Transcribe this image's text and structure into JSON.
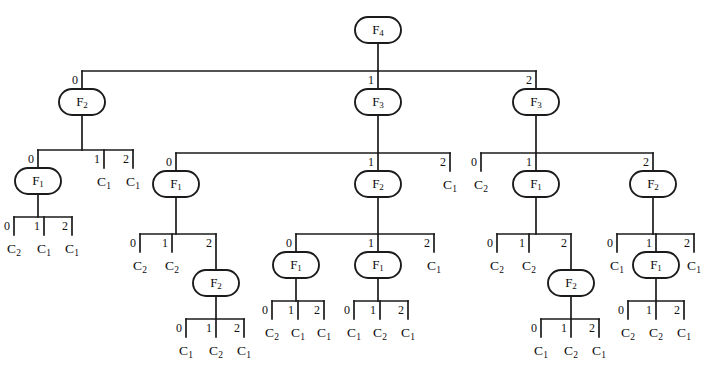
{
  "diagram": {
    "type": "tree",
    "node_shape": "rounded-rect",
    "edge_labels": [
      "0",
      "1",
      "2"
    ],
    "colors": {
      "stroke": "#1b1b1b",
      "text": "#0d0d0d",
      "background": "#ffffff"
    },
    "function_nodes": [
      "F4",
      "F3",
      "F2",
      "F1"
    ],
    "leaf_nodes": [
      "C1",
      "C2"
    ],
    "labels": {
      "F4": {
        "base": "F",
        "sub": "4"
      },
      "F3": {
        "base": "F",
        "sub": "3"
      },
      "F2": {
        "base": "F",
        "sub": "2"
      },
      "F1": {
        "base": "F",
        "sub": "1"
      },
      "C1": {
        "base": "C",
        "sub": "1"
      },
      "C2": {
        "base": "C",
        "sub": "2"
      }
    }
  },
  "tree": {
    "id": "n0",
    "label": "F4",
    "x": 378,
    "y": 30,
    "children": [
      {
        "edge": "0",
        "id": "n1",
        "label": "F2",
        "x": 82,
        "y": 102,
        "children": [
          {
            "edge": "0",
            "id": "n2",
            "label": "F1",
            "x": 38,
            "y": 181,
            "children": [
              {
                "edge": "0",
                "id": "n3",
                "label": "C2",
                "x": 14,
                "y": 248
              },
              {
                "edge": "1",
                "id": "n4",
                "label": "C1",
                "x": 44,
                "y": 248
              },
              {
                "edge": "2",
                "id": "n5",
                "label": "C1",
                "x": 72,
                "y": 248
              }
            ]
          },
          {
            "edge": "1",
            "id": "n6",
            "label": "C1",
            "x": 104,
            "y": 181
          },
          {
            "edge": "2",
            "id": "n7",
            "label": "C1",
            "x": 133,
            "y": 181
          }
        ]
      },
      {
        "edge": "1",
        "id": "n8",
        "label": "F3",
        "x": 378,
        "y": 102,
        "children": [
          {
            "edge": "0",
            "id": "n9",
            "label": "F1",
            "x": 176,
            "y": 184,
            "children": [
              {
                "edge": "0",
                "id": "n10",
                "label": "C2",
                "x": 140,
                "y": 265
              },
              {
                "edge": "1",
                "id": "n11",
                "label": "C2",
                "x": 172,
                "y": 265
              },
              {
                "edge": "2",
                "id": "n12",
                "label": "F2",
                "x": 216,
                "y": 283,
                "children": [
                  {
                    "edge": "0",
                    "id": "n13",
                    "label": "C1",
                    "x": 186,
                    "y": 350
                  },
                  {
                    "edge": "1",
                    "id": "n14",
                    "label": "C2",
                    "x": 216,
                    "y": 350
                  },
                  {
                    "edge": "2",
                    "id": "n15",
                    "label": "C1",
                    "x": 244,
                    "y": 350
                  }
                ]
              }
            ]
          },
          {
            "edge": "1",
            "id": "n16",
            "label": "F2",
            "x": 378,
            "y": 184,
            "children": [
              {
                "edge": "0",
                "id": "n17",
                "label": "F1",
                "x": 296,
                "y": 265,
                "children": [
                  {
                    "edge": "0",
                    "id": "n18",
                    "label": "C2",
                    "x": 272,
                    "y": 332
                  },
                  {
                    "edge": "1",
                    "id": "n19",
                    "label": "C1",
                    "x": 298,
                    "y": 332
                  },
                  {
                    "edge": "2",
                    "id": "n20",
                    "label": "C1",
                    "x": 324,
                    "y": 332
                  }
                ]
              },
              {
                "edge": "1",
                "id": "n21",
                "label": "F1",
                "x": 378,
                "y": 265,
                "children": [
                  {
                    "edge": "0",
                    "id": "n22",
                    "label": "C1",
                    "x": 354,
                    "y": 332
                  },
                  {
                    "edge": "1",
                    "id": "n23",
                    "label": "C2",
                    "x": 380,
                    "y": 332
                  },
                  {
                    "edge": "2",
                    "id": "n24",
                    "label": "C1",
                    "x": 408,
                    "y": 332
                  }
                ]
              },
              {
                "edge": "2",
                "id": "n25",
                "label": "C1",
                "x": 434,
                "y": 265
              }
            ]
          },
          {
            "edge": "2",
            "id": "n26",
            "label": "C1",
            "x": 450,
            "y": 184
          }
        ]
      },
      {
        "edge": "2",
        "id": "n27",
        "label": "F3",
        "x": 536,
        "y": 102,
        "children": [
          {
            "edge": "0",
            "id": "n28",
            "label": "C2",
            "x": 481,
            "y": 184
          },
          {
            "edge": "1",
            "id": "n29",
            "label": "F1",
            "x": 536,
            "y": 184,
            "children": [
              {
                "edge": "0",
                "id": "n30",
                "label": "C2",
                "x": 497,
                "y": 265
              },
              {
                "edge": "1",
                "id": "n31",
                "label": "C2",
                "x": 529,
                "y": 265
              },
              {
                "edge": "2",
                "id": "n32",
                "label": "F2",
                "x": 571,
                "y": 283,
                "children": [
                  {
                    "edge": "0",
                    "id": "n33",
                    "label": "C1",
                    "x": 541,
                    "y": 350
                  },
                  {
                    "edge": "1",
                    "id": "n34",
                    "label": "C2",
                    "x": 571,
                    "y": 350
                  },
                  {
                    "edge": "2",
                    "id": "n35",
                    "label": "C1",
                    "x": 599,
                    "y": 350
                  }
                ]
              }
            ]
          },
          {
            "edge": "2",
            "id": "n36",
            "label": "F2",
            "x": 653,
            "y": 184,
            "children": [
              {
                "edge": "0",
                "id": "n37",
                "label": "C1",
                "x": 617,
                "y": 265
              },
              {
                "edge": "1",
                "id": "n38",
                "label": "F1",
                "x": 656,
                "y": 265,
                "children": [
                  {
                    "edge": "0",
                    "id": "n39",
                    "label": "C2",
                    "x": 628,
                    "y": 332
                  },
                  {
                    "edge": "1",
                    "id": "n40",
                    "label": "C2",
                    "x": 656,
                    "y": 332
                  },
                  {
                    "edge": "2",
                    "id": "n41",
                    "label": "C1",
                    "x": 684,
                    "y": 332
                  }
                ]
              },
              {
                "edge": "2",
                "id": "n42",
                "label": "C1",
                "x": 694,
                "y": 265
              }
            ]
          }
        ]
      }
    ]
  }
}
